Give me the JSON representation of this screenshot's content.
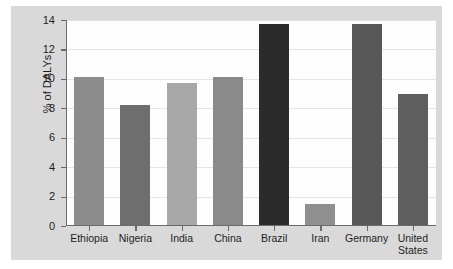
{
  "chart_data": {
    "type": "bar",
    "title": "",
    "xlabel": "",
    "ylabel": "% of DALYs",
    "ylim": [
      0,
      14
    ],
    "yticks": [
      0,
      2,
      4,
      6,
      8,
      10,
      12,
      14
    ],
    "ytick_labels": [
      "0",
      "2",
      "4",
      "6",
      "8",
      "10",
      "12",
      "14"
    ],
    "grid": true,
    "legend": false,
    "categories": [
      "Ethiopia",
      "Nigeria",
      "India",
      "China",
      "Brazil",
      "Iran",
      "Germany",
      "United States"
    ],
    "values": [
      10.1,
      8.25,
      9.75,
      10.15,
      13.75,
      1.5,
      13.7,
      9.0
    ],
    "bar_colors": [
      "#8d8d8d",
      "#6e6e6e",
      "#a8a8a8",
      "#8a8a8a",
      "#2b2b2b",
      "#8f8f8f",
      "#575757",
      "#5e5e5e"
    ],
    "bars": [
      {
        "category": "Ethiopia",
        "value": 10.1,
        "color": "#8d8d8d"
      },
      {
        "category": "Nigeria",
        "value": 8.25,
        "color": "#6e6e6e"
      },
      {
        "category": "India",
        "value": 9.75,
        "color": "#a8a8a8"
      },
      {
        "category": "China",
        "value": 10.15,
        "color": "#8a8a8a"
      },
      {
        "category": "Brazil",
        "value": 13.75,
        "color": "#2b2b2b"
      },
      {
        "category": "Iran",
        "value": 1.5,
        "color": "#8f8f8f"
      },
      {
        "category": "Germany",
        "value": 13.7,
        "color": "#575757"
      },
      {
        "category": "United States",
        "value": 9.0,
        "color": "#5e5e5e"
      }
    ]
  },
  "figure": {
    "panel_background": "#d9d9d9",
    "plot_background": "#fdfdfd",
    "axis_color": "#6a6a6a",
    "grid_color": "#e4e4e4"
  }
}
